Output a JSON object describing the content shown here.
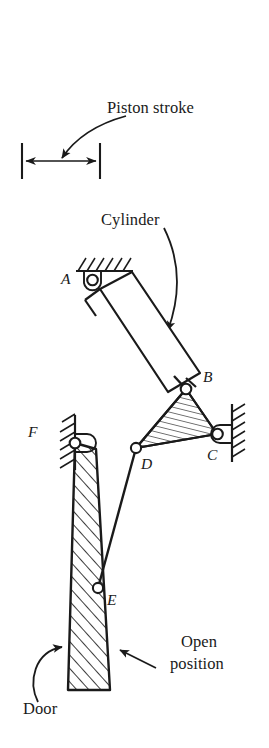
{
  "figure": {
    "background_color": "#ffffff",
    "line_color": "#1a1a1a",
    "width": 269,
    "height": 748
  },
  "callouts": {
    "piston_stroke": "Piston stroke",
    "cylinder": "Cylinder",
    "open_position_line1": "Open",
    "open_position_line2": "position",
    "door": "Door"
  },
  "point_labels": {
    "a": "A",
    "b": "B",
    "c": "C",
    "d": "D",
    "e": "E",
    "f": "F"
  },
  "geometry": {
    "joints": [
      {
        "name": "A",
        "x": 92,
        "y": 274,
        "type": "pinned-ground-pivot"
      },
      {
        "name": "B",
        "x": 186,
        "y": 389,
        "type": "pin-joint"
      },
      {
        "name": "C",
        "x": 217,
        "y": 434,
        "type": "pinned-ground-pivot"
      },
      {
        "name": "D",
        "x": 136,
        "y": 448,
        "type": "pin-joint"
      },
      {
        "name": "E",
        "x": 98,
        "y": 588,
        "type": "pin-joint"
      },
      {
        "name": "F",
        "x": 75,
        "y": 443,
        "type": "pinned-ground-pivot"
      }
    ],
    "piston_stroke_dimension": {
      "x1": 22,
      "x2": 100,
      "y": 161
    },
    "cylinder_body": {
      "corner_count": 4,
      "rotation_deg": 41
    },
    "door": {
      "hinge": "F",
      "base_y": 690,
      "base_x1": 68,
      "base_x2": 110
    },
    "ternary_link": {
      "vertices": [
        "B",
        "C",
        "D"
      ],
      "fill": "hatched"
    },
    "walls": [
      {
        "name": "ground-top-A",
        "orientation": "horizontal"
      },
      {
        "name": "wall-right-C",
        "orientation": "vertical"
      },
      {
        "name": "wall-left-F",
        "orientation": "vertical"
      }
    ]
  }
}
